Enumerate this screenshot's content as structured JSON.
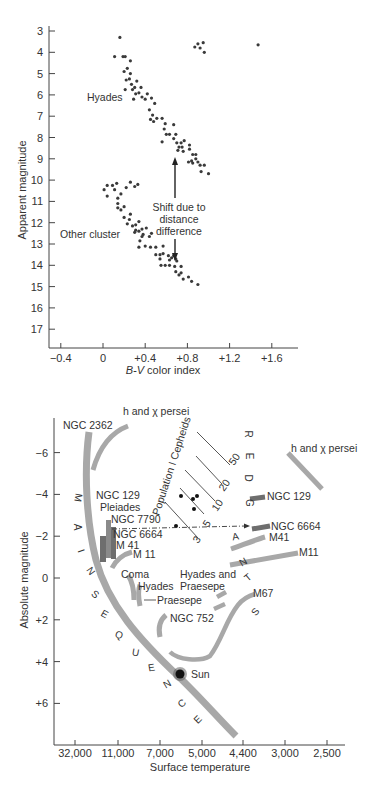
{
  "chart_data": [
    {
      "type": "scatter",
      "title": "",
      "xlabel": "B-V color index",
      "ylabel": "Apparent magnitude",
      "xlim": [
        -0.5,
        1.9
      ],
      "ylim": [
        17.8,
        2.8
      ],
      "y_inverted": true,
      "grid": false,
      "x_ticks": [
        "-0.4",
        "0",
        "+0.4",
        "+0.8",
        "+1.2",
        "+1.6"
      ],
      "x_tick_values": [
        -0.4,
        0,
        0.4,
        0.8,
        1.2,
        1.6
      ],
      "y_ticks": [
        "3",
        "4",
        "5",
        "6",
        "7",
        "8",
        "9",
        "10",
        "11",
        "12",
        "13",
        "14",
        "15",
        "16",
        "17"
      ],
      "y_tick_values": [
        3,
        4,
        5,
        6,
        7,
        8,
        9,
        10,
        11,
        12,
        13,
        14,
        15,
        16,
        17
      ],
      "series": [
        {
          "name": "Hyades",
          "points": [
            [
              0.16,
              3.3
            ],
            [
              0.11,
              4.2
            ],
            [
              0.19,
              4.2
            ],
            [
              0.21,
              4.2
            ],
            [
              0.26,
              4.4
            ],
            [
              0.2,
              4.9
            ],
            [
              0.23,
              4.75
            ],
            [
              0.26,
              5.0
            ],
            [
              0.25,
              5.25
            ],
            [
              0.22,
              5.3
            ],
            [
              0.21,
              5.75
            ],
            [
              0.27,
              5.5
            ],
            [
              0.32,
              5.35
            ],
            [
              0.28,
              5.75
            ],
            [
              0.3,
              5.65
            ],
            [
              0.31,
              5.95
            ],
            [
              0.34,
              5.9
            ],
            [
              0.36,
              5.65
            ],
            [
              0.37,
              6.1
            ],
            [
              0.29,
              6.2
            ],
            [
              0.42,
              5.95
            ],
            [
              0.4,
              6.2
            ],
            [
              0.46,
              6.15
            ],
            [
              0.49,
              6.4
            ],
            [
              0.44,
              6.7
            ],
            [
              0.47,
              6.95
            ],
            [
              0.45,
              7.15
            ],
            [
              0.48,
              7.25
            ],
            [
              0.51,
              7.1
            ],
            [
              0.56,
              7.1
            ],
            [
              0.59,
              7.35
            ],
            [
              0.58,
              7.6
            ],
            [
              0.6,
              7.85
            ],
            [
              0.63,
              7.85
            ],
            [
              0.67,
              7.4
            ],
            [
              0.69,
              7.85
            ],
            [
              0.67,
              8.05
            ],
            [
              0.56,
              8.2
            ],
            [
              0.7,
              8.25
            ],
            [
              0.72,
              8.45
            ],
            [
              0.74,
              8.25
            ],
            [
              0.77,
              8.15
            ],
            [
              0.75,
              8.45
            ],
            [
              0.76,
              8.65
            ],
            [
              0.71,
              8.6
            ],
            [
              0.82,
              8.35
            ],
            [
              0.82,
              8.55
            ],
            [
              0.85,
              8.8
            ],
            [
              0.88,
              8.8
            ],
            [
              0.84,
              9.1
            ],
            [
              0.88,
              9.0
            ],
            [
              0.9,
              9.15
            ],
            [
              0.92,
              9.3
            ],
            [
              0.85,
              9.2
            ],
            [
              0.81,
              9.15
            ],
            [
              0.96,
              9.3
            ],
            [
              0.93,
              9.6
            ],
            [
              1.0,
              9.7
            ],
            [
              0.87,
              3.75
            ],
            [
              0.9,
              3.6
            ],
            [
              0.92,
              3.8
            ],
            [
              0.95,
              3.55
            ],
            [
              0.96,
              4.0
            ],
            [
              1.47,
              3.65
            ]
          ]
        },
        {
          "name": "Other cluster",
          "points": [
            [
              0.01,
              10.45
            ],
            [
              0.04,
              10.25
            ],
            [
              0.09,
              10.25
            ],
            [
              0.13,
              10.15
            ],
            [
              0.26,
              10.1
            ],
            [
              0.3,
              10.3
            ],
            [
              0.33,
              10.2
            ],
            [
              0.11,
              10.45
            ],
            [
              0.17,
              10.65
            ],
            [
              0.04,
              10.75
            ],
            [
              0.22,
              10.35
            ],
            [
              0.14,
              10.85
            ],
            [
              0.14,
              11.1
            ],
            [
              0.14,
              11.3
            ],
            [
              0.17,
              11.4
            ],
            [
              0.2,
              11.25
            ],
            [
              0.2,
              11.75
            ],
            [
              0.26,
              11.6
            ],
            [
              0.25,
              11.85
            ],
            [
              0.23,
              12.05
            ],
            [
              0.28,
              12.15
            ],
            [
              0.31,
              12.1
            ],
            [
              0.34,
              11.95
            ],
            [
              0.31,
              12.35
            ],
            [
              0.3,
              12.45
            ],
            [
              0.34,
              12.4
            ],
            [
              0.37,
              12.3
            ],
            [
              0.38,
              12.55
            ],
            [
              0.41,
              12.25
            ],
            [
              0.35,
              12.85
            ],
            [
              0.37,
              12.65
            ],
            [
              0.44,
              12.65
            ],
            [
              0.46,
              12.5
            ],
            [
              0.34,
              13.15
            ],
            [
              0.4,
              13.1
            ],
            [
              0.45,
              13.15
            ],
            [
              0.5,
              13.15
            ],
            [
              0.57,
              13.1
            ],
            [
              0.5,
              13.5
            ],
            [
              0.54,
              13.5
            ],
            [
              0.57,
              13.45
            ],
            [
              0.54,
              13.7
            ],
            [
              0.62,
              13.55
            ],
            [
              0.65,
              13.65
            ],
            [
              0.67,
              13.55
            ],
            [
              0.69,
              13.7
            ],
            [
              0.7,
              13.8
            ],
            [
              0.63,
              13.75
            ],
            [
              0.55,
              14.0
            ],
            [
              0.59,
              14.0
            ],
            [
              0.63,
              14.0
            ],
            [
              0.68,
              14.05
            ],
            [
              0.74,
              14.05
            ],
            [
              0.69,
              14.3
            ],
            [
              0.72,
              14.45
            ],
            [
              0.74,
              14.35
            ],
            [
              0.76,
              14.65
            ],
            [
              0.81,
              14.55
            ],
            [
              0.84,
              14.75
            ],
            [
              0.9,
              14.9
            ]
          ]
        }
      ],
      "annotations": [
        {
          "text": "Hyades",
          "x": 0.05,
          "y": 6.1
        },
        {
          "text": "Other cluster",
          "x": -0.02,
          "y": 12.55
        },
        {
          "text": "Shift due to",
          "x": 0.7,
          "y": 11.1
        },
        {
          "text": "distance",
          "x": 0.7,
          "y": 11.7
        },
        {
          "text": "difference",
          "x": 0.7,
          "y": 12.3
        }
      ],
      "arrow": {
        "x": 0.7,
        "from_y": 12.5,
        "to_y": 13.8,
        "tail_y": 9.0,
        "head_up_y": 8.8
      }
    },
    {
      "type": "line",
      "title": "",
      "xlabel": "Surface temperature",
      "ylabel": "Absolute magnitude",
      "ylim": [
        7.8,
        -7.2
      ],
      "y_inverted": true,
      "grid": false,
      "x_ticks": [
        "32,000",
        "11,000",
        "7,000",
        "5,000",
        "4,400",
        "3,000",
        "2,500"
      ],
      "y_ticks": [
        "-6",
        "-4",
        "-2",
        "0",
        "+2",
        "+4",
        "+6"
      ],
      "y_tick_values": [
        -6,
        -4,
        -2,
        0,
        2,
        4,
        6
      ],
      "series": [
        {
          "name": "Main sequence",
          "group": "main"
        },
        {
          "name": "NGC 2362",
          "turnoff_mag": -7
        },
        {
          "name": "h and χ persei",
          "turnoff_mag": -6.5
        },
        {
          "name": "NGC 129",
          "turnoff_mag": -3.5
        },
        {
          "name": "Pleiades",
          "turnoff_mag": -3
        },
        {
          "name": "NGC 7790",
          "turnoff_mag": -2.5
        },
        {
          "name": "NGC 6664",
          "turnoff_mag": -2
        },
        {
          "name": "M 41",
          "turnoff_mag": -1.5
        },
        {
          "name": "M 11",
          "turnoff_mag": -1
        },
        {
          "name": "Coma",
          "turnoff_mag": 0.5
        },
        {
          "name": "Hyades",
          "turnoff_mag": 1
        },
        {
          "name": "Praesepe",
          "turnoff_mag": 1
        },
        {
          "name": "NGC 752",
          "turnoff_mag": 2
        },
        {
          "name": "M67",
          "turnoff_mag": 3.5
        }
      ],
      "giant_branch_labels": [
        "h and χ persei",
        "NGC 129",
        "NGC 6664",
        "M41",
        "M11",
        "Hyades and",
        "Praesepe",
        "M67"
      ],
      "cepheid_period_lines": [
        "3",
        "5",
        "10",
        "20",
        "50"
      ],
      "annotations": [
        "Population I Cepheids",
        "MAIN SEQUENCE",
        "RED GIANTS",
        "Sun"
      ]
    }
  ],
  "top_chart": {
    "xlabel": "B-V color index",
    "ylabel": "Apparent magnitude",
    "label_hyades": "Hyades",
    "label_other": "Other cluster",
    "shift_line1": "Shift due to",
    "shift_line2": "distance",
    "shift_line3": "difference"
  },
  "bottom_chart": {
    "xlabel": "Surface temperature",
    "ylabel": "Absolute magnitude",
    "labels": {
      "ngc2362": "NGC 2362",
      "hchi_top": "h and χ persei",
      "hchi_right": "h and χ persei",
      "ngc129_left": "NGC 129",
      "pleiades": "Pleiades",
      "ngc7790": "NGC 7790",
      "ngc6664_left": "NGC 6664",
      "m41_left": "M 41",
      "m11_left": "M 11",
      "coma": "Coma",
      "hyades": "Hyades",
      "praesepe": "Praesepe",
      "ngc752": "NGC 752",
      "hyades_and": "Hyades and",
      "praesepe_right": "Praesepe",
      "m67": "M67",
      "ngc129_right": "NGC 129",
      "ngc6664_right": "NGC 6664",
      "m41_right": "M41",
      "m11_right": "M11",
      "sun": "Sun",
      "cepheids": "Population I Cepheids",
      "p3": "3",
      "p5": "5",
      "p10": "10",
      "p20": "20",
      "p50": "50"
    },
    "main_sequence_letters": [
      "M",
      "A",
      "I",
      "N",
      "S",
      "E",
      "Q",
      "U",
      "E",
      "N",
      "C",
      "E"
    ],
    "red_letters": [
      "R",
      "E",
      "D",
      "G"
    ],
    "giants_letters": [
      "A",
      "N",
      "T",
      "S"
    ]
  },
  "colors": {
    "band": "#a8a8a8",
    "band_dark": "#6e6e6e",
    "dot": "#3a3a3a",
    "axis": "#444444",
    "text": "#333333"
  }
}
